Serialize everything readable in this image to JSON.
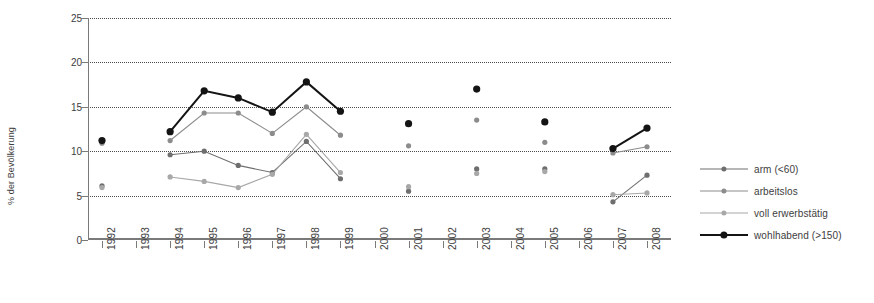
{
  "chart_data": {
    "type": "line",
    "title": "",
    "xlabel": "",
    "ylabel": "% der Bevölkerung",
    "ylim": [
      0,
      25
    ],
    "ytick_values": [
      0,
      5,
      10,
      15,
      20,
      25
    ],
    "ytick_labels": [
      "0",
      "5",
      "10",
      "15",
      "20",
      "25"
    ],
    "grid": "horizontal-dotted",
    "legend_position": "right",
    "x": [
      1992,
      1993,
      1994,
      1995,
      1996,
      1997,
      1998,
      1999,
      2000,
      2001,
      2002,
      2003,
      2004,
      2005,
      2006,
      2007,
      2008
    ],
    "categories": [
      "1992",
      "1993",
      "1994",
      "1995",
      "1996",
      "1997",
      "1998",
      "1999",
      "2000",
      "2001",
      "2002",
      "2003",
      "2004",
      "2005",
      "2006",
      "2007",
      "2008"
    ],
    "series": [
      {
        "name": "arm (<60)",
        "color": "#6e6e6e",
        "values": [
          6.1,
          null,
          9.6,
          10.0,
          8.4,
          7.6,
          11.1,
          6.9,
          null,
          5.5,
          null,
          8.0,
          null,
          8.0,
          null,
          4.3,
          7.3
        ]
      },
      {
        "name": "arbeitslos",
        "color": "#8c8c8c",
        "values": [
          10.9,
          null,
          11.2,
          14.3,
          14.3,
          12.0,
          15.0,
          11.8,
          null,
          10.6,
          null,
          13.5,
          null,
          11.0,
          null,
          9.8,
          10.5
        ]
      },
      {
        "name": "voll erwerbstätig",
        "color": "#a8a8a8",
        "values": [
          5.9,
          null,
          7.1,
          6.6,
          5.9,
          7.4,
          11.9,
          7.6,
          null,
          6.0,
          null,
          7.5,
          null,
          7.7,
          null,
          5.1,
          5.3
        ]
      },
      {
        "name": "wohlhabend (>150)",
        "color": "#141414",
        "values": [
          11.2,
          null,
          12.2,
          16.8,
          16.0,
          14.4,
          17.8,
          14.5,
          null,
          13.1,
          null,
          17.0,
          null,
          13.3,
          null,
          10.3,
          12.6
        ]
      }
    ]
  },
  "legend": {
    "items": [
      {
        "label": "arm (<60)"
      },
      {
        "label": "arbeitslos"
      },
      {
        "label": "voll erwerbstätig"
      },
      {
        "label": "wohlhabend (>150)"
      }
    ]
  }
}
